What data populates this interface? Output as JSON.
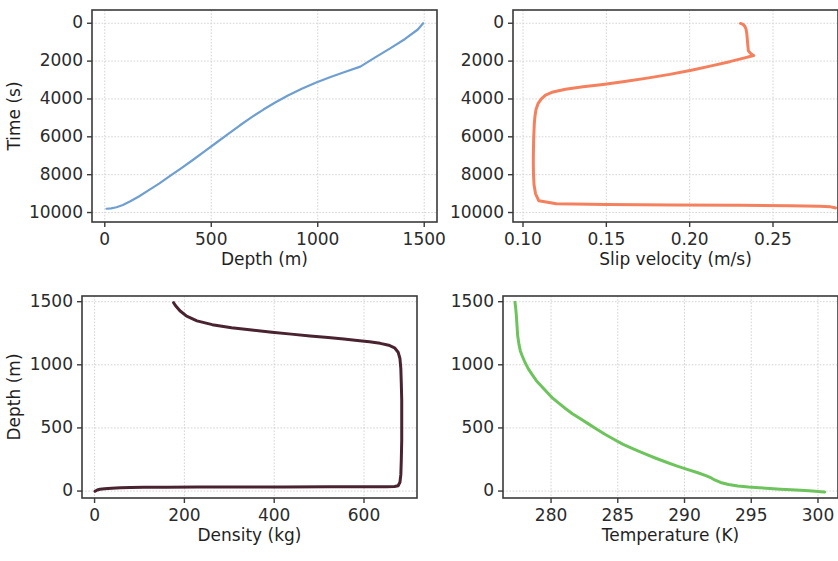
{
  "figure": {
    "width": 838,
    "height": 561,
    "background": "#ffffff",
    "note": "2x2 grid of line plots; right column is cropped at the image right edge"
  },
  "chart_data": [
    {
      "id": "time-vs-depth",
      "position": "top-left",
      "type": "line",
      "title": "",
      "xlabel": "Depth (m)",
      "ylabel": "Time (s)",
      "xlim": [
        -60,
        1560
      ],
      "ylim": [
        -700,
        10500
      ],
      "xticks": [
        0,
        500,
        1000,
        1500
      ],
      "yticks": [
        0,
        2000,
        4000,
        6000,
        8000,
        10000
      ],
      "xtick_labels": [
        "0",
        "500",
        "1000",
        "1500"
      ],
      "ytick_labels": [
        "0",
        "2000",
        "4000",
        "6000",
        "8000",
        "10000"
      ],
      "grid": true,
      "legend": "none",
      "color": "#6f9fd0",
      "linewidth": 2.2,
      "x": [
        8,
        30,
        55,
        85,
        120,
        160,
        205,
        255,
        305,
        360,
        415,
        470,
        525,
        580,
        635,
        690,
        745,
        800,
        860,
        925,
        990,
        1060,
        1130,
        1200,
        1270,
        1340,
        1410,
        1470,
        1495
      ],
      "y": [
        9800,
        9780,
        9720,
        9600,
        9400,
        9150,
        8830,
        8470,
        8080,
        7650,
        7210,
        6760,
        6300,
        5840,
        5390,
        4960,
        4560,
        4190,
        3820,
        3460,
        3140,
        2840,
        2560,
        2290,
        1800,
        1330,
        830,
        330,
        0
      ]
    },
    {
      "id": "slip-velocity-vs-time",
      "position": "top-right",
      "type": "line",
      "title": "",
      "xlabel": "Slip velocity (m/s)",
      "ylabel": "",
      "xlim": [
        0.094,
        0.289
      ],
      "ylim": [
        -700,
        10500
      ],
      "xticks": [
        0.1,
        0.15,
        0.2,
        0.25
      ],
      "yticks": [
        0,
        2000,
        4000,
        6000,
        8000,
        10000
      ],
      "xtick_labels": [
        "0.10",
        "0.15",
        "0.20",
        "0.25"
      ],
      "ytick_labels": [
        "0",
        "2000",
        "4000",
        "6000",
        "8000",
        "10000"
      ],
      "grid": true,
      "legend": "none",
      "cropped_right": true,
      "color": "#f4805e",
      "linewidth": 3.0,
      "x": [
        0.2305,
        0.232,
        0.233,
        0.2338,
        0.2342,
        0.2345,
        0.2348,
        0.2352,
        0.2368,
        0.2384,
        0.233,
        0.224,
        0.213,
        0.201,
        0.188,
        0.1745,
        0.161,
        0.148,
        0.136,
        0.1255,
        0.118,
        0.1135,
        0.111,
        0.109,
        0.1078,
        0.1072,
        0.1068,
        0.1066,
        0.1064,
        0.1063,
        0.1062,
        0.1062,
        0.1063,
        0.1066,
        0.1075,
        0.1095,
        0.12,
        0.15,
        0.19,
        0.23,
        0.26,
        0.278,
        0.2845,
        0.2865,
        0.2875
      ],
      "y": [
        10,
        60,
        150,
        300,
        500,
        760,
        1080,
        1450,
        1620,
        1700,
        1830,
        2030,
        2250,
        2480,
        2700,
        2900,
        3080,
        3230,
        3360,
        3490,
        3630,
        3800,
        4000,
        4250,
        4550,
        4900,
        5280,
        5680,
        6100,
        6550,
        7020,
        7500,
        8000,
        8520,
        9000,
        9380,
        9540,
        9575,
        9600,
        9620,
        9640,
        9670,
        9700,
        9730,
        9760
      ]
    },
    {
      "id": "density-vs-depth",
      "position": "bottom-left",
      "type": "line",
      "title": "",
      "xlabel": "Density (kg)",
      "ylabel": "Depth (m)",
      "xlim": [
        -28,
        718
      ],
      "ylim": [
        1545,
        -55
      ],
      "y_inverted": true,
      "xticks": [
        0,
        200,
        400,
        600
      ],
      "yticks": [
        0,
        500,
        1000,
        1500
      ],
      "xtick_labels": [
        "0",
        "200",
        "400",
        "600"
      ],
      "ytick_labels": [
        "0",
        "500",
        "1000",
        "1500"
      ],
      "grid": true,
      "legend": "none",
      "color": "#4a2330",
      "linewidth": 3.0,
      "x": [
        1,
        3,
        6,
        12,
        22,
        38,
        58,
        80,
        110,
        160,
        230,
        320,
        420,
        520,
        600,
        650,
        668,
        676,
        680,
        682,
        683,
        684,
        684,
        684,
        683,
        682,
        680,
        676,
        668,
        655,
        636,
        612,
        585,
        555,
        520,
        480,
        438,
        395,
        350,
        305,
        262,
        228,
        205,
        190,
        180,
        176
      ],
      "y": [
        -2,
        2,
        8,
        14,
        19,
        23,
        26,
        28,
        30,
        31,
        32,
        33,
        33,
        34,
        34,
        35,
        36,
        42,
        70,
        130,
        240,
        400,
        560,
        720,
        860,
        970,
        1050,
        1100,
        1135,
        1155,
        1170,
        1182,
        1193,
        1204,
        1216,
        1229,
        1243,
        1258,
        1275,
        1294,
        1318,
        1348,
        1385,
        1428,
        1470,
        1492
      ]
    },
    {
      "id": "temperature-vs-depth",
      "position": "bottom-right",
      "type": "line",
      "title": "",
      "xlabel": "Temperature (K)",
      "ylabel": "",
      "xlim": [
        276.4,
        301.5
      ],
      "ylim": [
        1545,
        -55
      ],
      "y_inverted": true,
      "xticks": [
        280,
        285,
        290,
        295,
        300
      ],
      "yticks": [
        0,
        500,
        1000,
        1500
      ],
      "xtick_labels": [
        "280",
        "285",
        "290",
        "295",
        "300"
      ],
      "ytick_labels": [
        "0",
        "500",
        "1000",
        "1500"
      ],
      "grid": true,
      "legend": "none",
      "cropped_right": true,
      "color": "#6ec45c",
      "linewidth": 3.0,
      "x": [
        300.5,
        300.2,
        299.8,
        299.3,
        298.7,
        298.0,
        297.2,
        296.4,
        295.6,
        294.8,
        294.0,
        293.3,
        292.7,
        292.3,
        292.0,
        291.6,
        291.0,
        290.2,
        289.4,
        288.6,
        287.8,
        287.0,
        286.2,
        285.4,
        284.7,
        284.0,
        283.4,
        282.8,
        282.2,
        281.6,
        281.1,
        280.6,
        280.1,
        279.7,
        279.3,
        278.9,
        278.6,
        278.3,
        278.05,
        277.85,
        277.7,
        277.6,
        277.5,
        277.45,
        277.4,
        277.35,
        277.3
      ],
      "y": [
        -8,
        -5,
        -2,
        2,
        6,
        10,
        15,
        20,
        26,
        32,
        40,
        52,
        68,
        86,
        104,
        122,
        145,
        172,
        200,
        230,
        262,
        296,
        332,
        370,
        410,
        452,
        492,
        532,
        572,
        612,
        652,
        694,
        738,
        782,
        828,
        874,
        920,
        968,
        1018,
        1068,
        1110,
        1160,
        1230,
        1310,
        1390,
        1450,
        1495
      ]
    }
  ]
}
